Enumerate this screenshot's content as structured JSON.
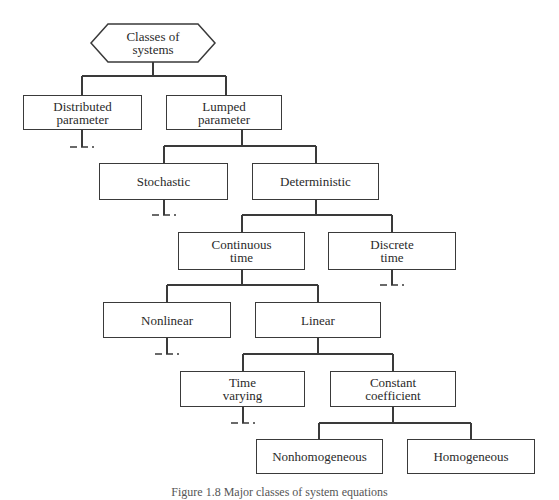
{
  "root": {
    "label": "Classes of\nsystems"
  },
  "nodes": {
    "distributed": {
      "label": "Distributed\nparameter"
    },
    "lumped": {
      "label": "Lumped\nparameter"
    },
    "stochastic": {
      "label": "Stochastic"
    },
    "deterministic": {
      "label": "Deterministic"
    },
    "continuous": {
      "label": "Continuous\ntime"
    },
    "discrete": {
      "label": "Discrete\ntime"
    },
    "nonlinear": {
      "label": "Nonlinear"
    },
    "linear": {
      "label": "Linear"
    },
    "time_varying": {
      "label": "Time\nvarying"
    },
    "constant": {
      "label": "Constant\ncoefficient"
    },
    "nonhomogeneous": {
      "label": "Nonhomogeneous"
    },
    "homogeneous": {
      "label": "Homogeneous"
    }
  },
  "caption": "Figure 1.8 Major classes of system equations",
  "colors": {
    "line": "#3a3a3a",
    "text": "#2a2a2a",
    "background": "#ffffff"
  }
}
